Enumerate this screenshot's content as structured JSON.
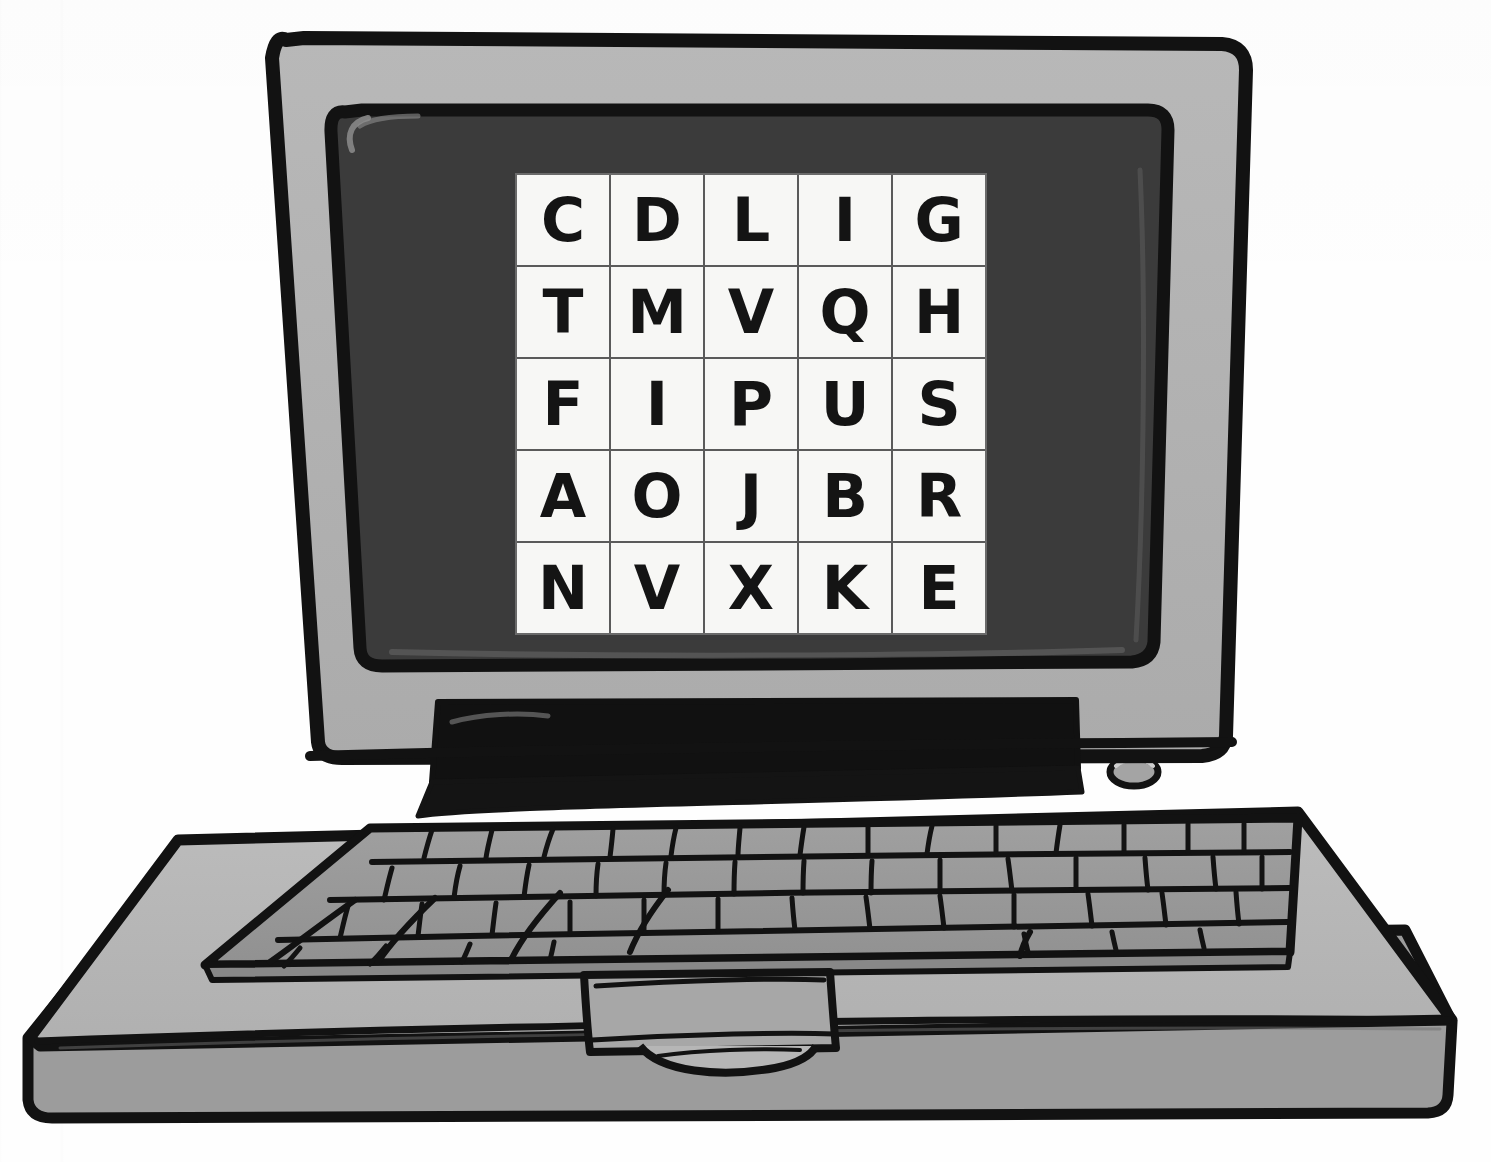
{
  "scene": {
    "subject": "laptop-computer-illustration",
    "style": "hand-drawn-flat-illustration",
    "background_color": "#fefefe"
  },
  "device": {
    "name": "laptop",
    "lid_color": "#b3b3b3",
    "screen_color": "#3b3b3b",
    "base_top_color": "#b5b5b5",
    "base_front_color": "#9c9c9c",
    "keyboard_color": "#9a9a9a",
    "outline_color": "#121212",
    "hinge_bar_color": "#111111",
    "power_button_label": "power-button",
    "trackpad_label": "trackpad",
    "keyboard_rows": 4
  },
  "screen": {
    "display_label": "letter-grid-display",
    "grid": {
      "rows": 5,
      "columns": 5,
      "cell_background": "#f7f7f5",
      "line_color": "#5a5a5a",
      "letter_color": "#141414",
      "letters": [
        [
          "C",
          "D",
          "L",
          "I",
          "G"
        ],
        [
          "T",
          "M",
          "V",
          "Q",
          "H"
        ],
        [
          "F",
          "I",
          "P",
          "U",
          "S"
        ],
        [
          "A",
          "O",
          "J",
          "B",
          "R"
        ],
        [
          "N",
          "V",
          "X",
          "K",
          "E"
        ]
      ]
    }
  }
}
